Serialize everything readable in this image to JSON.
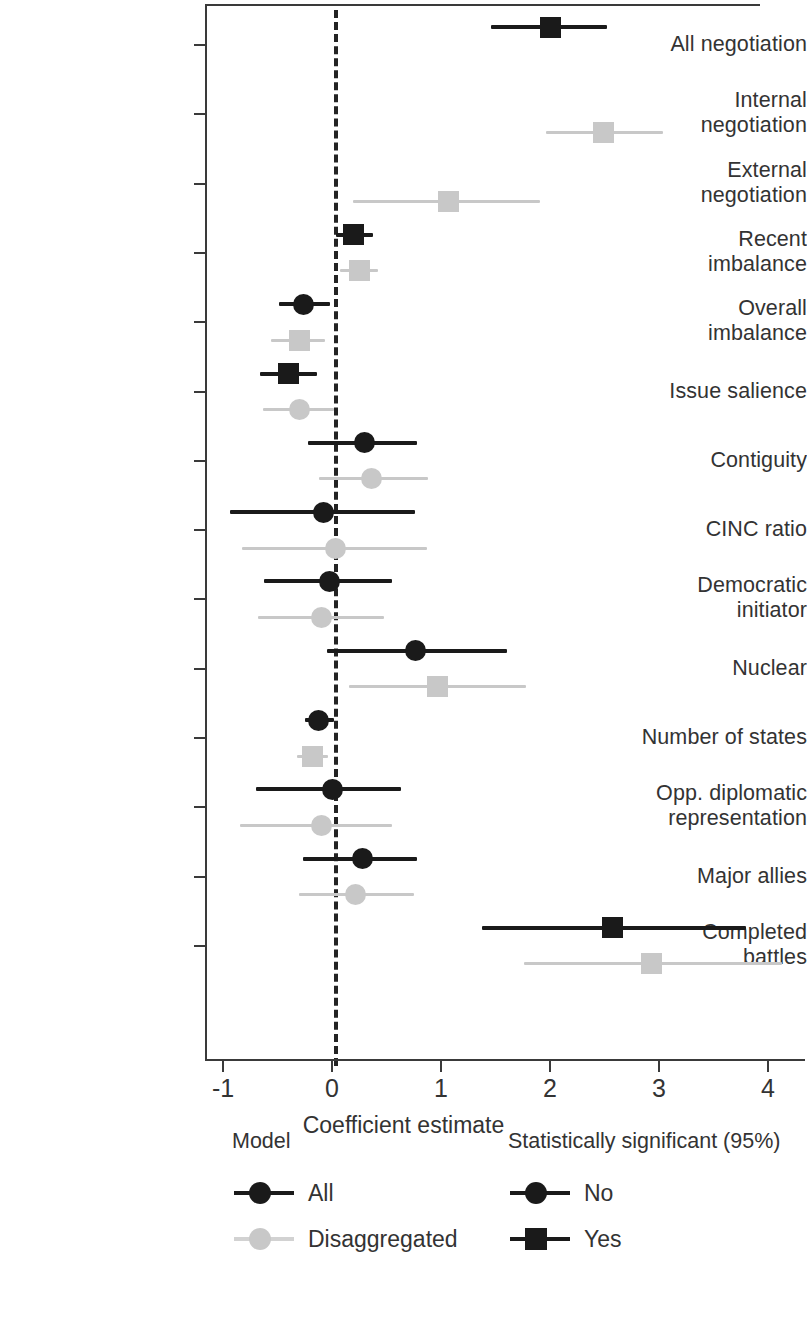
{
  "chart_data": {
    "type": "scatter",
    "title": "",
    "xlabel": "Coefficient estimate",
    "ylabel": "",
    "xlim": [
      -1.2,
      4.35
    ],
    "xticks": [
      -1,
      0,
      1,
      2,
      3,
      4
    ],
    "xticklabels": [
      "-1",
      "0",
      "1",
      "2",
      "3",
      "4"
    ],
    "grid": false,
    "reference_line": 0,
    "categories": [
      "All negotiation",
      "Internal negotiation",
      "External negotiation",
      "Recent imbalance",
      "Overall imbalance",
      "Issue salience",
      "Contiguity",
      "CINC ratio",
      "Democratic initiator",
      "Nuclear",
      "Number of states",
      "Opp. diplomatic representation",
      "Major allies",
      "Completed battles"
    ],
    "series": [
      {
        "name": "All",
        "color": "#1a1a1a",
        "points": [
          {
            "category": "All negotiation",
            "estimate": 2.0,
            "low": 1.46,
            "high": 2.52,
            "significant": "Yes",
            "marker": "square"
          },
          {
            "category": "Internal negotiation",
            "estimate": null,
            "low": null,
            "high": null,
            "significant": null,
            "marker": null
          },
          {
            "category": "External negotiation",
            "estimate": null,
            "low": null,
            "high": null,
            "significant": null,
            "marker": null
          },
          {
            "category": "Recent imbalance",
            "estimate": 0.2,
            "low": 0.04,
            "high": 0.38,
            "significant": "Yes",
            "marker": "square"
          },
          {
            "category": "Overall imbalance",
            "estimate": -0.26,
            "low": -0.49,
            "high": -0.02,
            "significant": "No",
            "marker": "circle"
          },
          {
            "category": "Issue salience",
            "estimate": -0.4,
            "low": -0.66,
            "high": -0.14,
            "significant": "Yes",
            "marker": "square"
          },
          {
            "category": "Contiguity",
            "estimate": 0.3,
            "low": -0.22,
            "high": 0.78,
            "significant": "No",
            "marker": "circle"
          },
          {
            "category": "CINC ratio",
            "estimate": -0.08,
            "low": -0.94,
            "high": 0.76,
            "significant": "No",
            "marker": "circle"
          },
          {
            "category": "Democratic initiator",
            "estimate": -0.02,
            "low": -0.62,
            "high": 0.55,
            "significant": "No",
            "marker": "circle"
          },
          {
            "category": "Nuclear",
            "estimate": 0.77,
            "low": -0.05,
            "high": 1.61,
            "significant": "No",
            "marker": "circle"
          },
          {
            "category": "Number of states",
            "estimate": -0.12,
            "low": -0.25,
            "high": 0.02,
            "significant": "No",
            "marker": "circle"
          },
          {
            "category": "Opp. diplomatic representation",
            "estimate": 0.0,
            "low": -0.7,
            "high": 0.63,
            "significant": "No",
            "marker": "circle"
          },
          {
            "category": "Major allies",
            "estimate": 0.28,
            "low": -0.27,
            "high": 0.78,
            "significant": "No",
            "marker": "circle"
          },
          {
            "category": "Completed battles",
            "estimate": 2.57,
            "low": 1.38,
            "high": 3.8,
            "significant": "Yes",
            "marker": "square"
          }
        ]
      },
      {
        "name": "Disaggregated",
        "color": "#c8c8c8",
        "points": [
          {
            "category": "All negotiation",
            "estimate": null,
            "low": null,
            "high": null,
            "significant": null,
            "marker": null
          },
          {
            "category": "Internal negotiation",
            "estimate": 2.49,
            "low": 1.96,
            "high": 3.04,
            "significant": "Yes",
            "marker": "square"
          },
          {
            "category": "External negotiation",
            "estimate": 1.07,
            "low": 0.19,
            "high": 1.91,
            "significant": "Yes",
            "marker": "square"
          },
          {
            "category": "Recent imbalance",
            "estimate": 0.25,
            "low": 0.07,
            "high": 0.42,
            "significant": "Yes",
            "marker": "square"
          },
          {
            "category": "Overall imbalance",
            "estimate": -0.3,
            "low": -0.56,
            "high": -0.06,
            "significant": "Yes",
            "marker": "square"
          },
          {
            "category": "Issue salience",
            "estimate": -0.3,
            "low": -0.63,
            "high": 0.02,
            "significant": "No",
            "marker": "circle"
          },
          {
            "category": "Contiguity",
            "estimate": 0.36,
            "low": -0.12,
            "high": 0.88,
            "significant": "No",
            "marker": "circle"
          },
          {
            "category": "CINC ratio",
            "estimate": 0.03,
            "low": -0.83,
            "high": 0.87,
            "significant": "No",
            "marker": "circle"
          },
          {
            "category": "Democratic initiator",
            "estimate": -0.1,
            "low": -0.68,
            "high": 0.48,
            "significant": "No",
            "marker": "circle"
          },
          {
            "category": "Nuclear",
            "estimate": 0.97,
            "low": 0.16,
            "high": 1.78,
            "significant": "Yes",
            "marker": "square"
          },
          {
            "category": "Number of states",
            "estimate": -0.18,
            "low": -0.32,
            "high": -0.04,
            "significant": "Yes",
            "marker": "square"
          },
          {
            "category": "Opp. diplomatic representation",
            "estimate": -0.1,
            "low": -0.84,
            "high": 0.55,
            "significant": "No",
            "marker": "circle"
          },
          {
            "category": "Major allies",
            "estimate": 0.22,
            "low": -0.3,
            "high": 0.75,
            "significant": "No",
            "marker": "circle"
          },
          {
            "category": "Completed battles",
            "estimate": 2.93,
            "low": 1.76,
            "high": 4.13,
            "significant": "Yes",
            "marker": "square"
          }
        ]
      }
    ],
    "legends": [
      {
        "title": "Model",
        "entries": [
          {
            "label": "All",
            "color": "#1a1a1a",
            "marker": "circle"
          },
          {
            "label": "Disaggregated",
            "color": "#c8c8c8",
            "marker": "circle"
          }
        ]
      },
      {
        "title": "Statistically\nsignificant (95%)",
        "title_line1": "Statistically",
        "title_line2": "significant (95%)",
        "entries": [
          {
            "label": "No",
            "color": "#1a1a1a",
            "marker": "circle"
          },
          {
            "label": "Yes",
            "color": "#1a1a1a",
            "marker": "square"
          }
        ]
      }
    ],
    "colors": {
      "all": "#1a1a1a",
      "disaggregated": "#c8c8c8",
      "axis": "#3a3a3a",
      "text": "#333333",
      "background": "#ffffff"
    }
  }
}
